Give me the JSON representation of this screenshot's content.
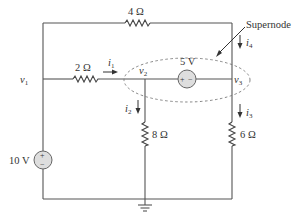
{
  "diagram": {
    "type": "electrical circuit schematic",
    "annotation": {
      "label": "Supernode"
    },
    "nodes": {
      "v1": {
        "name": "v",
        "sub": "1"
      },
      "v2": {
        "name": "v",
        "sub": "2"
      },
      "v3": {
        "name": "v",
        "sub": "3"
      }
    },
    "components": {
      "r_top": {
        "label": "4 Ω",
        "value_ohms": 4,
        "between": [
          "v1",
          "v3"
        ]
      },
      "r_mid": {
        "label": "2 Ω",
        "value_ohms": 2,
        "between": [
          "v1",
          "v2"
        ]
      },
      "r_v2": {
        "label": "8 Ω",
        "value_ohms": 8,
        "between": [
          "v2",
          "ground"
        ]
      },
      "r_v3": {
        "label": "6 Ω",
        "value_ohms": 6,
        "between": [
          "v3",
          "ground"
        ]
      },
      "vs_left": {
        "label": "10 V",
        "value_volts": 10,
        "plus": "+",
        "minus": "−",
        "between": [
          "v1",
          "ground"
        ]
      },
      "vs_super": {
        "label": "5 V",
        "value_volts": 5,
        "plus": "+",
        "minus": "−",
        "between": [
          "v2",
          "v3"
        ]
      }
    },
    "currents": {
      "i1": {
        "name": "i",
        "sub": "1",
        "direction": "right",
        "through": "2 Ω"
      },
      "i2": {
        "name": "i",
        "sub": "2",
        "direction": "down",
        "through": "8 Ω"
      },
      "i3": {
        "name": "i",
        "sub": "3",
        "direction": "down",
        "through": "6 Ω"
      },
      "i4": {
        "name": "i",
        "sub": "4",
        "direction": "down",
        "through": "4 Ω branch into v3"
      }
    },
    "colors": {
      "wire": "#555555",
      "source_fill": "#dedede",
      "text": "#333333",
      "dashed_outline": "#777777"
    }
  }
}
